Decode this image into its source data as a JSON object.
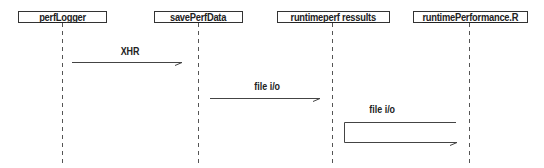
{
  "diagram": {
    "type": "sequence",
    "colors": {
      "line": "#444444",
      "lifeline": "#555555",
      "text": "#222222",
      "background": "#ffffff"
    },
    "actors": [
      {
        "name": "perfLogger"
      },
      {
        "name": "savePerfData"
      },
      {
        "name": "runtimeperf ressults"
      },
      {
        "name": "runtimePerformance.R"
      }
    ],
    "messages": [
      {
        "from": "perfLogger",
        "to": "savePerfData",
        "label": "XHR"
      },
      {
        "from": "savePerfData",
        "to": "runtimeperf ressults",
        "label": "file i/o"
      },
      {
        "from": "runtimePerformance.R",
        "to": "runtimePerformance.R",
        "label": "file i/o",
        "self": true
      }
    ]
  }
}
